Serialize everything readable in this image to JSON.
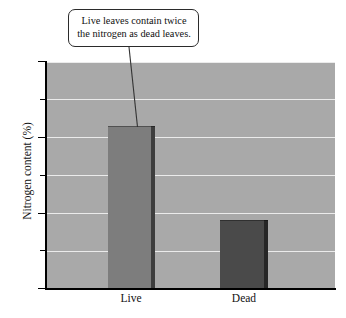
{
  "chart_data": {
    "type": "bar",
    "title": "",
    "xlabel": "",
    "ylabel": "Nitrogen content (%)",
    "categories": [
      "Live",
      "Dead"
    ],
    "values": [
      2.15,
      0.9
    ],
    "ylim": [
      0,
      3
    ],
    "ytick_labels": [
      "0",
      "1",
      "2",
      "3"
    ],
    "ytick_values": [
      0,
      1,
      2,
      3
    ],
    "minor_tick_values": [
      0.5,
      1.5,
      2.5
    ],
    "gridlines": [
      0.5,
      1,
      1.5,
      2,
      2.5,
      3
    ],
    "grid": true,
    "legend": "none",
    "annotations": [
      {
        "text": "Live leaves contain twice the nitrogen as dead leaves.",
        "points_to": "Live"
      }
    ],
    "series": [
      {
        "name": "Nitrogen content",
        "values": [
          2.15,
          0.9
        ]
      }
    ],
    "bar_colors": [
      "#7d7d7d",
      "#4a4a4a"
    ],
    "plot_background": "#a9a9a9",
    "gridline_color": "#ebebeb"
  },
  "axes": {
    "y_title": "Nitrogen content (%)",
    "y_labels": {
      "t0": "0",
      "t1": "1",
      "t2": "2",
      "t3": "3"
    },
    "x_labels": {
      "c0": "Live",
      "c1": "Dead"
    }
  },
  "callout": {
    "text": "Live leaves contain twice the nitrogen as dead leaves."
  }
}
